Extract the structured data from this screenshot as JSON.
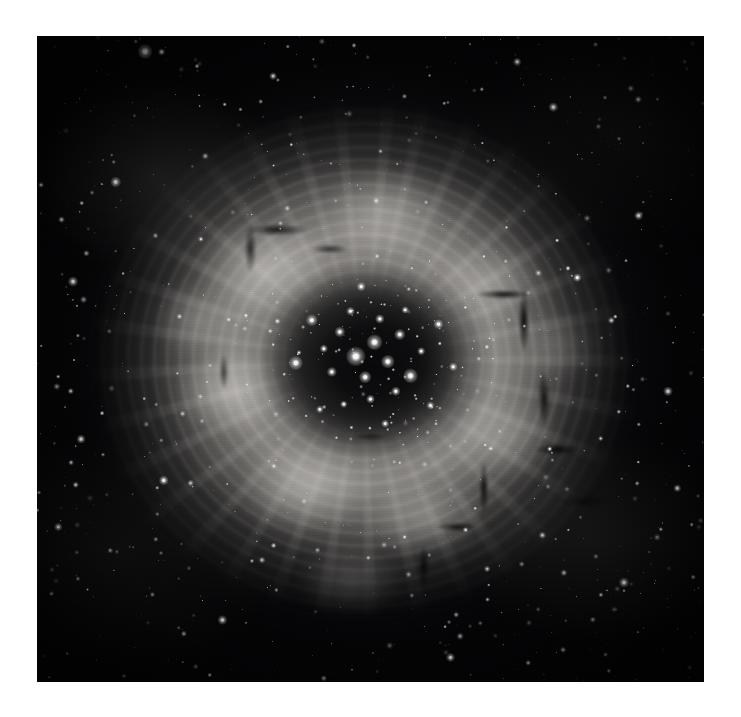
{
  "page": {
    "background_color": "#ffffff",
    "width": 741,
    "height": 717
  },
  "image": {
    "name": "rosette-nebula-photograph",
    "kind": "astronomical-photograph",
    "subject": "Rosette Nebula (NGC 2237) with open cluster NGC 2244",
    "rendering": "monochrome / grayscale",
    "plate": {
      "x": 37,
      "y": 36,
      "width": 667,
      "height": 646
    },
    "palette": {
      "sky_background": "#050507",
      "nebula_mid": "#8e8a84",
      "nebula_bright": "#bab6af",
      "dust_lane": "#020203",
      "star_white": "#ffffff",
      "page_white": "#ffffff"
    },
    "features": {
      "central_cavity": {
        "cx_pct": 50.5,
        "cy_pct": 50.5,
        "rx_pct": 17.7,
        "ry_pct": 15.5
      },
      "nebula_ring": {
        "cx_pct": 49,
        "cy_pct": 50,
        "rx_pct": 45,
        "ry_pct": 44
      },
      "halo": {
        "cx_pct": 50,
        "cy_pct": 49,
        "rx_pct": 49.5,
        "ry_pct": 48.8
      }
    },
    "cluster_stars": [
      [
        50.6,
        47.4,
        5.2
      ],
      [
        47.8,
        49.6,
        6.4
      ],
      [
        52.6,
        50.4,
        4.4
      ],
      [
        49.2,
        52.8,
        4.0
      ],
      [
        54.4,
        46.2,
        3.6
      ],
      [
        45.4,
        45.8,
        3.4
      ],
      [
        56.0,
        52.6,
        4.8
      ],
      [
        44.2,
        52.0,
        3.2
      ],
      [
        51.4,
        43.8,
        3.0
      ],
      [
        47.0,
        42.6,
        2.8
      ],
      [
        53.8,
        55.0,
        3.0
      ],
      [
        43.0,
        48.4,
        2.6
      ],
      [
        57.6,
        48.8,
        2.6
      ],
      [
        50.0,
        56.2,
        2.8
      ],
      [
        46.0,
        57.0,
        2.4
      ],
      [
        55.2,
        42.4,
        2.4
      ],
      [
        41.2,
        44.0,
        3.8
      ],
      [
        60.2,
        44.6,
        3.2
      ],
      [
        59.0,
        57.2,
        2.6
      ],
      [
        42.4,
        57.8,
        2.4
      ],
      [
        38.8,
        50.6,
        4.6
      ],
      [
        62.4,
        51.2,
        2.8
      ],
      [
        48.6,
        38.8,
        3.0
      ],
      [
        52.2,
        60.0,
        2.6
      ]
    ],
    "bright_field_stars": [
      [
        16.2,
        2.4,
        5.0
      ],
      [
        11.8,
        22.6,
        3.6
      ],
      [
        77.4,
        11.0,
        3.2
      ],
      [
        90.2,
        27.8,
        3.0
      ],
      [
        5.4,
        38.0,
        3.4
      ],
      [
        94.6,
        55.0,
        3.2
      ],
      [
        6.6,
        62.4,
        3.0
      ],
      [
        88.0,
        84.6,
        3.4
      ],
      [
        27.8,
        90.4,
        3.2
      ],
      [
        62.0,
        96.2,
        3.0
      ],
      [
        72.0,
        4.0,
        2.8
      ],
      [
        35.4,
        6.2,
        2.6
      ],
      [
        3.2,
        76.0,
        2.8
      ],
      [
        96.0,
        70.0,
        2.6
      ],
      [
        19.0,
        68.8,
        3.2
      ],
      [
        81.0,
        37.4,
        2.8
      ]
    ],
    "star_count_estimate": 1400,
    "annotations": [],
    "text_elements": []
  }
}
